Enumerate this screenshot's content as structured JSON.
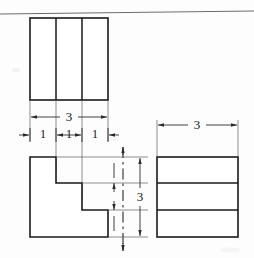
{
  "sheet": {
    "title": "Orthographic Projection Multiview Drawing",
    "background_color": "#fdfdfd",
    "line_color": "#1a1a1a",
    "dimension_color": "#2a2a2a",
    "extension_color": "#5d5d5d",
    "rule_color": "#6b6b6b",
    "width": 254,
    "height": 258
  },
  "views": {
    "top_view": {
      "name": "top-view",
      "outline": "rectangle",
      "x": 30,
      "y": 18,
      "width": 78,
      "height": 82,
      "internal_dividers": [
        "vertical",
        "vertical"
      ],
      "divider_x": [
        56,
        82
      ],
      "segments": 3
    },
    "front_view": {
      "name": "front-view",
      "outline": "stepped-L-profile",
      "x": 30,
      "y": 157,
      "width": 78,
      "height": 80,
      "step_count": 3,
      "step_corners_x": [
        56,
        82,
        108
      ],
      "step_corners_y": [
        183,
        210,
        237
      ],
      "path": "M30,157 L56,157 L56,183 L82,183 L82,210 L108,210 L108,237 L30,237 Z"
    },
    "side_view": {
      "name": "right-side-view",
      "outline": "rectangle",
      "x": 157,
      "y": 157,
      "width": 81,
      "height": 80,
      "internal_dividers": [
        "horizontal",
        "horizontal"
      ],
      "divider_y": [
        183,
        210
      ],
      "segments": 3
    }
  },
  "dimensions": {
    "top_overall_width": {
      "name": "dimension-top-width",
      "label": "3",
      "value": 3,
      "orientation": "horizontal",
      "y": 117,
      "x_start": 30,
      "x_end": 108,
      "text_x": 69,
      "text_y": 117
    },
    "top_segments": [
      {
        "name": "dimension-segment-1",
        "label": "1",
        "value": 1,
        "orientation": "horizontal",
        "y": 135,
        "x_start": 30,
        "x_end": 56,
        "text_x": 43,
        "text_y": 135,
        "arrow_style": "outside"
      },
      {
        "name": "dimension-segment-2",
        "label": "1",
        "value": 1,
        "orientation": "horizontal",
        "y": 135,
        "x_start": 56,
        "x_end": 82,
        "text_x": 69,
        "text_y": 135,
        "arrow_style": "inside"
      },
      {
        "name": "dimension-segment-3",
        "label": "1",
        "value": 1,
        "orientation": "horizontal",
        "y": 135,
        "x_start": 82,
        "x_end": 108,
        "text_x": 95,
        "text_y": 135,
        "arrow_style": "outside"
      }
    ],
    "vertical_height": {
      "name": "dimension-vertical-height",
      "label": "3",
      "value": 3,
      "orientation": "vertical",
      "x": 140,
      "y_start": 157,
      "y_end": 237,
      "text_x": 140,
      "text_y": 197
    },
    "side_width": {
      "name": "dimension-side-width",
      "label": "3",
      "value": 3,
      "orientation": "horizontal",
      "y": 125,
      "x_start": 157,
      "x_end": 238,
      "text_x": 197,
      "text_y": 125
    }
  },
  "centerline": {
    "name": "projection-centerline",
    "orientation": "vertical",
    "x": 123,
    "y_start": 147,
    "y_end": 251,
    "style": "dash-dot"
  },
  "sheet_rule": {
    "name": "sheet-top-rule",
    "x_start": 0,
    "y_start": 14,
    "x_end": 254,
    "y_end": 11
  }
}
